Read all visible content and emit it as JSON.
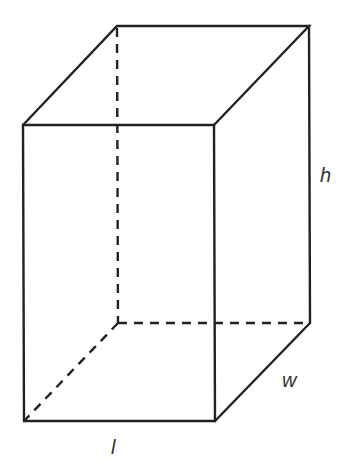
{
  "diagram": {
    "type": "rectangular-prism",
    "labels": {
      "height": "h",
      "width": "w",
      "length": "l"
    },
    "edge_color": "#222222",
    "hidden_edges_style": "dashed"
  }
}
